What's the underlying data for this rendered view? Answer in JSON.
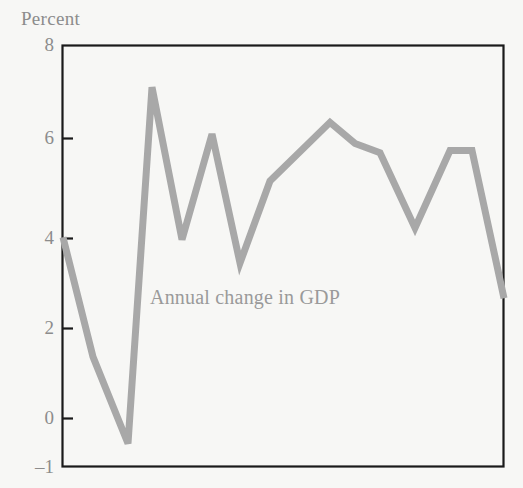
{
  "figure": {
    "axis_unit_label": "Percent",
    "background_color": "#f7f7f5",
    "frame_color": "#1a1a1a",
    "text_color": "#8c8c8c"
  },
  "chart_data": {
    "type": "line",
    "title": "",
    "subtitle": "",
    "xlabel": "",
    "ylabel": "Percent",
    "ylim": [
      -1,
      8
    ],
    "yticks": [
      8,
      6,
      4,
      2,
      0,
      -1
    ],
    "ytick_labels": [
      "8",
      "6",
      "4",
      "2",
      "0",
      "–1"
    ],
    "xticks": [],
    "xtick_labels": [],
    "grid": false,
    "legend": "none",
    "annotations": [
      {
        "text": "Annual change in GDP",
        "x_frac": 0.2,
        "y_value": 2.6,
        "color": "#9a9a9a"
      }
    ],
    "series": [
      {
        "name": "Annual change in GDP",
        "color": "#a8a8a8",
        "line_width": 7,
        "x": [
          0,
          1,
          2,
          3,
          4,
          5,
          6,
          7,
          8,
          9,
          10,
          11,
          12,
          13,
          14
        ],
        "values": [
          3.9,
          1.35,
          -0.5,
          7.1,
          3.85,
          6.1,
          3.35,
          5.1,
          6.35,
          5.9,
          5.7,
          4.1,
          5.75,
          5.75,
          2.6
        ],
        "x_px": [
          63,
          93,
          128,
          152,
          182,
          212,
          240,
          270,
          330,
          355,
          380,
          415,
          450,
          472,
          504
        ]
      }
    ]
  },
  "ytick_positions_px": {
    "8": 45,
    "6": 138,
    "4": 238,
    "2": 328,
    "0": 418,
    "-1": 467
  },
  "plot_frame_px": {
    "left": 62,
    "top": 45,
    "right": 504,
    "bottom": 467
  }
}
